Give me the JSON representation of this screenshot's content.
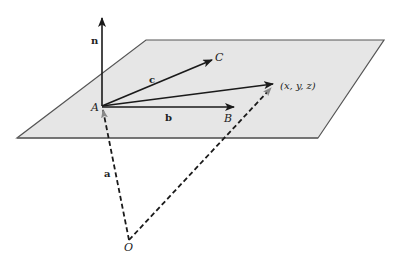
{
  "diagram": {
    "colors": {
      "plane_fill": "#e6e6e6",
      "plane_edge": "#555555",
      "solid_vector": "#1a1a1a",
      "dashed_vector": "#1a1a1a"
    },
    "labels": {
      "normal": "n",
      "vector_c": "c",
      "vector_b": "b",
      "vector_a": "a",
      "point_A": "A",
      "point_B": "B",
      "point_C": "C",
      "point_O": "O",
      "point_general": "(x, y, z)"
    },
    "vectors": [
      {
        "name": "n",
        "from": "A",
        "to": "n-tip",
        "style": "solid"
      },
      {
        "name": "c",
        "from": "A",
        "to": "C",
        "style": "solid"
      },
      {
        "name": "b",
        "from": "A",
        "to": "B",
        "style": "solid"
      },
      {
        "name": "r",
        "from": "A",
        "to": "(x, y, z)",
        "style": "solid"
      },
      {
        "name": "a",
        "from": "O",
        "to": "A",
        "style": "dashed"
      },
      {
        "name": "r-from-O",
        "from": "O",
        "to": "(x, y, z)",
        "style": "dashed"
      }
    ]
  }
}
